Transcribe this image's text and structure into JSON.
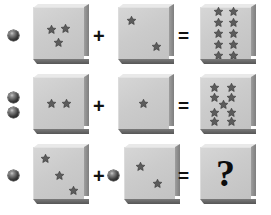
{
  "puzzle": {
    "title": "Star and sphere arithmetic analogy puzzle",
    "background_color": "#ffffff",
    "block_face_color": "#cbcbcb",
    "star_color": "#5c5c5c",
    "sphere_color": "#2a2a2a",
    "operator_color": "#111111",
    "operators": {
      "plus": "+",
      "equals": "=",
      "unknown": "?"
    },
    "rows": [
      {
        "id": "row-1",
        "left_spheres": 1,
        "left_block": {
          "star_count": 3,
          "layout": "cluster-top",
          "stars": [
            {
              "x": 13,
              "y": 17,
              "size": 11
            },
            {
              "x": 27,
              "y": 16,
              "size": 11
            },
            {
              "x": 20,
              "y": 30,
              "size": 11
            }
          ]
        },
        "middle_spheres": 0,
        "middle_block": {
          "star_count": 2,
          "layout": "diagonal",
          "stars": [
            {
              "x": 8,
              "y": 8,
              "size": 11
            },
            {
              "x": 33,
              "y": 34,
              "size": 11
            }
          ]
        },
        "result_block": {
          "star_count": 10,
          "layout": "grid",
          "grid_columns": 2,
          "grid_rows": 5,
          "star_size": 11
        }
      },
      {
        "id": "row-2",
        "left_spheres": 2,
        "left_block": {
          "star_count": 2,
          "layout": "pair-center",
          "stars": [
            {
              "x": 13,
              "y": 21,
              "size": 11
            },
            {
              "x": 28,
              "y": 21,
              "size": 11
            }
          ]
        },
        "middle_spheres": 0,
        "middle_block": {
          "star_count": 1,
          "layout": "center",
          "stars": [
            {
              "x": 20,
              "y": 21,
              "size": 11
            }
          ]
        },
        "result_block": {
          "star_count": 9,
          "layout": "hourglass",
          "stars": [
            {
              "x": 9,
              "y": 5,
              "size": 11
            },
            {
              "x": 26,
              "y": 5,
              "size": 11
            },
            {
              "x": 9,
              "y": 15,
              "size": 11
            },
            {
              "x": 26,
              "y": 15,
              "size": 11
            },
            {
              "x": 18,
              "y": 22,
              "size": 11
            },
            {
              "x": 9,
              "y": 30,
              "size": 11
            },
            {
              "x": 26,
              "y": 30,
              "size": 11
            },
            {
              "x": 9,
              "y": 39,
              "size": 11
            },
            {
              "x": 26,
              "y": 39,
              "size": 11
            }
          ]
        }
      },
      {
        "id": "row-3",
        "left_spheres": 1,
        "left_block": {
          "star_count": 3,
          "layout": "diagonal",
          "stars": [
            {
              "x": 7,
              "y": 6,
              "size": 11
            },
            {
              "x": 21,
              "y": 23,
              "size": 11
            },
            {
              "x": 35,
              "y": 38,
              "size": 11
            }
          ]
        },
        "middle_spheres": 1,
        "middle_block": {
          "star_count": 2,
          "layout": "diagonal",
          "stars": [
            {
              "x": 11,
              "y": 14,
              "size": 11
            },
            {
              "x": 28,
              "y": 31,
              "size": 11
            }
          ]
        },
        "result_block": {
          "star_count": 0,
          "layout": "unknown",
          "label": "?"
        }
      }
    ]
  }
}
